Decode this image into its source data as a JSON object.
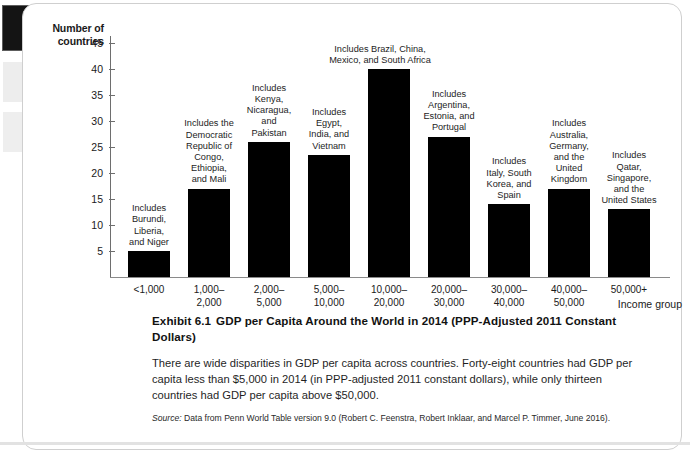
{
  "chart_data": {
    "type": "bar",
    "title": "GDP per Capita Around the World in 2014 (PPP-Adjusted 2011 Constant Dollars)",
    "xlabel": "Income group",
    "ylabel": "Number of countries",
    "ylim": [
      0,
      45
    ],
    "yticks": [
      5,
      10,
      15,
      20,
      25,
      30,
      35,
      40,
      45
    ],
    "grid": false,
    "legend": "none",
    "categories": [
      "<1,000",
      "1,000–\n2,000",
      "2,000–\n5,000",
      "5,000–\n10,000",
      "10,000–\n20,000",
      "20,000–\n30,000",
      "30,000–\n40,000",
      "40,000–\n50,000",
      "50,000+"
    ],
    "values": [
      5,
      17,
      26,
      23.5,
      40,
      27,
      14,
      17,
      13
    ],
    "annotations": [
      "Includes Burundi, Liberia, and Niger",
      "Includes the Democratic Republic of Congo, Ethiopia, and Mali",
      "Includes Kenya, Nicaragua, and Pakistan",
      "Includes Egypt, India, and Vietnam",
      "Includes Brazil, China, Mexico, and South Africa",
      "Includes Argentina, Estonia, and Portugal",
      "Includes Italy, South Korea, and Spain",
      "Includes Australia, Germany, and the United Kingdom",
      "Includes Qatar, Singapore, and the United States"
    ]
  },
  "axes": {
    "y_title_line1": "Number of",
    "y_title_line2": "countries",
    "x_title": "Income group",
    "y_tick_labels": [
      "45",
      "40",
      "35",
      "30",
      "25",
      "20",
      "15",
      "10",
      "5"
    ]
  },
  "bars": [
    {
      "id": "bar-lt-1000",
      "value": 5,
      "x_label_line1": "<1,000",
      "x_label_line2": "",
      "note_lines": [
        "Includes",
        "Burundi,",
        "Liberia,",
        "and Niger"
      ]
    },
    {
      "id": "bar-1000-2000",
      "value": 17,
      "x_label_line1": "1,000–",
      "x_label_line2": "2,000",
      "note_lines": [
        "Includes the",
        "Democratic",
        "Republic of",
        "Congo,",
        "Ethiopia,",
        "and Mali"
      ]
    },
    {
      "id": "bar-2000-5000",
      "value": 26,
      "x_label_line1": "2,000–",
      "x_label_line2": "5,000",
      "note_lines": [
        "Includes",
        "Kenya,",
        "Nicaragua,",
        "and",
        "Pakistan"
      ]
    },
    {
      "id": "bar-5000-10000",
      "value": 23.5,
      "x_label_line1": "5,000–",
      "x_label_line2": "10,000",
      "note_lines": [
        "Includes",
        "Egypt,",
        "India, and",
        "Vietnam"
      ]
    },
    {
      "id": "bar-10000-20000",
      "value": 40,
      "x_label_line1": "10,000–",
      "x_label_line2": "20,000",
      "note_lines": [
        "Includes Brazil, China,",
        "Mexico, and South Africa"
      ]
    },
    {
      "id": "bar-20000-30000",
      "value": 27,
      "x_label_line1": "20,000–",
      "x_label_line2": "30,000",
      "note_lines": [
        "Includes",
        "Argentina,",
        "Estonia, and",
        "Portugal"
      ]
    },
    {
      "id": "bar-30000-40000",
      "value": 14,
      "x_label_line1": "30,000–",
      "x_label_line2": "40,000",
      "note_lines": [
        "Includes",
        "Italy, South",
        "Korea, and",
        "Spain"
      ]
    },
    {
      "id": "bar-40000-50000",
      "value": 17,
      "x_label_line1": "40,000–",
      "x_label_line2": "50,000",
      "note_lines": [
        "Includes",
        "Australia,",
        "Germany,",
        "and the",
        "United",
        "Kingdom"
      ]
    },
    {
      "id": "bar-50000-plus",
      "value": 13,
      "x_label_line1": "50,000+",
      "x_label_line2": "",
      "note_lines": [
        "Includes",
        "Qatar,",
        "Singapore,",
        "and the",
        "United States"
      ]
    }
  ],
  "caption": {
    "exhibit_label": "Exhibit 6.1",
    "exhibit_title": "GDP per Capita Around the World in 2014 (PPP-Adjusted 2011 Constant Dollars)",
    "body": "There are wide disparities in GDP per capita across countries. Forty-eight countries had GDP per capita less than $5,000 in 2014 (in PPP-adjusted 2011 constant dollars), while only thirteen countries had GDP per capita above $50,000.",
    "source_label": "Source:",
    "source_text": "Data from Penn World Table version 9.0 (Robert C. Feenstra, Robert Inklaar, and Marcel P. Timmer, June 2016)."
  },
  "colors": {
    "bar_fill": "#000000",
    "axis": "#6e6e6e",
    "card_border": "#cfcfcf",
    "text": "#1a1a1a"
  }
}
